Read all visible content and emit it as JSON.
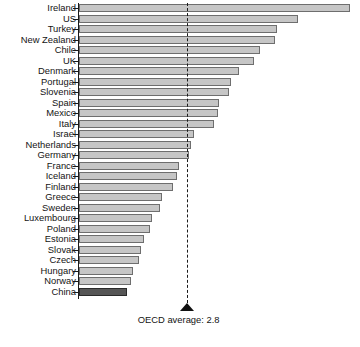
{
  "chart_data": {
    "type": "bar",
    "orientation": "horizontal",
    "title": "",
    "subtitle": "",
    "xlabel": "",
    "ylabel": "",
    "xlim": [
      0,
      7.2
    ],
    "grid": false,
    "legend": null,
    "categories": [
      "Ireland",
      "US",
      "Turkey",
      "New Zealand",
      "Chile",
      "UK",
      "Denmark",
      "Portugal",
      "Slovenia",
      "Spain",
      "Mexico",
      "Italy",
      "Israel",
      "Netherlands",
      "Germany",
      "France",
      "Iceland",
      "Finland",
      "Greece",
      "Sweden",
      "Luxembourg",
      "Poland",
      "Estonia",
      "Slovak",
      "Czech",
      "Hungary",
      "Norway",
      "China"
    ],
    "values": [
      7.05,
      5.7,
      5.15,
      5.1,
      4.7,
      4.55,
      4.15,
      3.95,
      3.9,
      3.65,
      3.6,
      3.5,
      3.0,
      2.9,
      2.85,
      2.6,
      2.55,
      2.45,
      2.15,
      2.1,
      1.9,
      1.85,
      1.7,
      1.6,
      1.55,
      1.4,
      1.35,
      1.25
    ],
    "highlight_category": "China",
    "reference_line": {
      "label": "OECD average: 2.8",
      "value": 2.8
    },
    "colors": {
      "bar_fill": "#c6c6c6",
      "bar_stroke": "#6e6e6e",
      "highlight_fill": "#565656",
      "highlight_stroke": "#2a2a2a",
      "axis": "#1a1a1a",
      "text": "#141414"
    }
  },
  "footer": {
    "fragment": ""
  }
}
